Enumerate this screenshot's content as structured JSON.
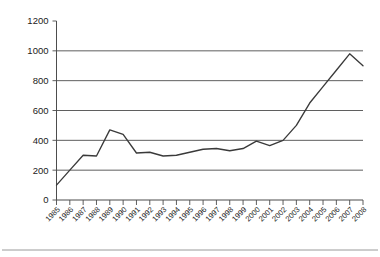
{
  "chart_data": {
    "type": "line",
    "title": "",
    "subtitle": "",
    "xlabel": "",
    "ylabel": "",
    "grid": true,
    "legend": false,
    "legend_position": "none",
    "line_color": "#3a3a3a",
    "grid_color": "#4d4d4d",
    "axis_color": "#4d4d4d",
    "background_color": "#ffffff",
    "ylim": [
      0,
      1200
    ],
    "ytick_step": 200,
    "ytick_labels": [
      "0",
      "200",
      "400",
      "600",
      "800",
      "1000",
      "1200"
    ],
    "ytick_values": [
      0,
      200,
      400,
      600,
      800,
      1000,
      1200
    ],
    "xtick_labels": [
      "1985",
      "1986",
      "1987",
      "1988",
      "1989",
      "1990",
      "1991",
      "1992",
      "1993",
      "1994",
      "1995",
      "1996",
      "1997",
      "1998",
      "1999",
      "2000",
      "2001",
      "2002",
      "2003",
      "2004",
      "2005",
      "2006",
      "2007",
      "2008"
    ],
    "xtick_rotation": -45,
    "categories": [
      "1985",
      "1986",
      "1987",
      "1988",
      "1989",
      "1990",
      "1991",
      "1992",
      "1993",
      "1994",
      "1995",
      "1996",
      "1997",
      "1998",
      "1999",
      "2000",
      "2001",
      "2002",
      "2003",
      "2004",
      "2005",
      "2006",
      "2007",
      "2008"
    ],
    "values": [
      100,
      200,
      300,
      295,
      470,
      440,
      315,
      320,
      295,
      300,
      320,
      340,
      345,
      330,
      345,
      395,
      365,
      400,
      500,
      650,
      760,
      870,
      980,
      900
    ],
    "series": [
      {
        "name": "Series 1",
        "values": [
          100,
          200,
          300,
          295,
          470,
          440,
          315,
          320,
          295,
          300,
          320,
          340,
          345,
          330,
          345,
          395,
          365,
          400,
          500,
          650,
          760,
          870,
          980,
          900
        ]
      }
    ],
    "annotations": []
  },
  "figure": {
    "footer_rule": true
  }
}
